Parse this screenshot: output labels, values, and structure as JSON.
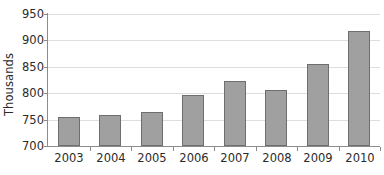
{
  "chart_data": {
    "type": "bar",
    "title": "",
    "xlabel": "",
    "ylabel": "Thousands",
    "categories": [
      "2003",
      "2004",
      "2005",
      "2006",
      "2007",
      "2008",
      "2009",
      "2010"
    ],
    "values": [
      755,
      759,
      765,
      796,
      823,
      806,
      856,
      918
    ],
    "ylim": [
      700,
      950
    ],
    "yticks": [
      700,
      750,
      800,
      850,
      900,
      950
    ],
    "ytick_labels": [
      "700",
      "750",
      "800",
      "850",
      "900",
      "950"
    ],
    "grid": true,
    "legend": false,
    "legend_position": "none",
    "bar_color": "#a0a0a0",
    "bar_border_color": "#6e6e6e",
    "gridline_color": "#dedede",
    "axis_color": "#8c8c8c",
    "text_color": "#2b2b2b",
    "background_color": "#ffffff"
  }
}
